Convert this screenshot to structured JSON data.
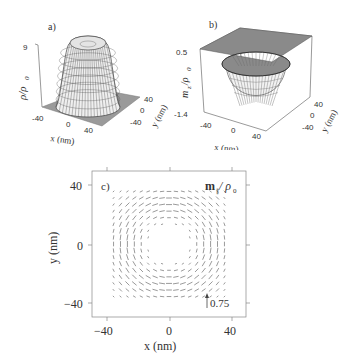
{
  "chart_data": [
    {
      "panel": "a)",
      "type": "surface3d",
      "title": "",
      "zlabel": "ρ/ρ₀",
      "xlabel": "x (nm)",
      "ylabel": "y (nm)",
      "z_ticks": [
        "9"
      ],
      "x_ticks": [
        "-40",
        "0",
        "40"
      ],
      "y_ticks": [
        "40",
        "0",
        "-40"
      ],
      "xlim": [
        -50,
        50
      ],
      "ylim": [
        -50,
        50
      ],
      "zlim": [
        0,
        9
      ],
      "description": "Flat-topped mesa (~9 ρ₀) centered at origin, radius ~25 nm, slight dip at top center"
    },
    {
      "panel": "b)",
      "type": "surface3d",
      "zlabel": "m_z/ρ₀",
      "xlabel": "x (nm)",
      "ylabel": "y (nm)",
      "z_ticks": [
        "0.5",
        "-1.4"
      ],
      "x_ticks": [
        "-40",
        "0",
        "40"
      ],
      "y_ticks": [
        "40",
        "0",
        "-40"
      ],
      "xlim": [
        -50,
        50
      ],
      "ylim": [
        -50,
        50
      ],
      "zlim": [
        -1.4,
        0.5
      ],
      "description": "Flat plane at 0 with deep well down to ~-1.4 in center, ring rim slightly positive"
    },
    {
      "panel": "c)",
      "type": "quiver",
      "title": "m∥ / ρ₀",
      "xlabel": "x (nm)",
      "ylabel": "y (nm)",
      "x_ticks": [
        "-40",
        "0",
        "40"
      ],
      "y_ticks": [
        "40",
        "0",
        "-40"
      ],
      "xlim": [
        -50,
        50
      ],
      "ylim": [
        -50,
        50
      ],
      "reference_arrow": {
        "value": "0.75",
        "direction": "up"
      },
      "field": {
        "pattern": "square vortex ring, horizontal flow in top/bottom bands, vertical flow on left/right sides, empty core",
        "inner_radius_nm": 12,
        "outer_radius_nm": 36,
        "grid_spacing_nm": 4.5
      }
    }
  ],
  "labels": {
    "panel_a": "a)",
    "panel_b": "b)",
    "panel_c": "c)",
    "a_zlabel": "ρ/ρ",
    "a_zlabel_sub": "0",
    "a_ztick_top": "9",
    "b_zlabel": "m",
    "b_zlabel_sub": "z",
    "b_zlabel_rest": "/ρ",
    "b_zlabel_sub2": "0",
    "b_ztick_top": "0.5",
    "b_ztick_bottom": "-1.4",
    "x_tick_neg": "-40",
    "x_tick_zero": "0",
    "x_tick_pos": "40",
    "y_tick_pos": "40",
    "y_tick_zero": "0",
    "y_tick_neg": "-40",
    "c_x_tick_neg": "−40",
    "c_y_tick_neg": "−40",
    "xlabel": "x (nm)",
    "ylabel": "y (nm)",
    "c_title_m": "m",
    "c_title_sub": "∥",
    "c_title_rest": "/ ρ",
    "c_title_sub2": "0",
    "ref_value": "0.75"
  }
}
